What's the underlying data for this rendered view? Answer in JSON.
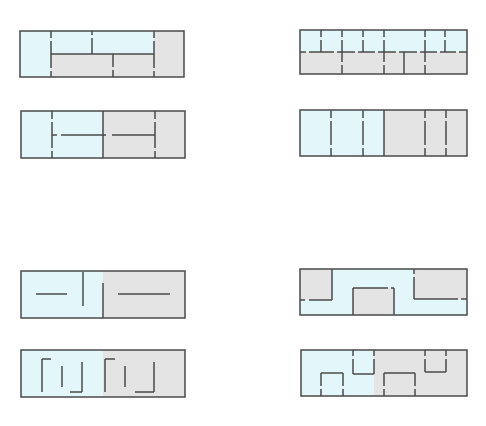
{
  "colors": {
    "blue": "#e3f6f9",
    "gray": "#e4e4e4",
    "line": "#4a4a4a",
    "background": "#ffffff"
  },
  "diagrams": [
    {
      "id": "d1",
      "position": "top-left-row1",
      "box": [
        20,
        31,
        184,
        77
      ],
      "fills": [
        {
          "color": "blue",
          "rect": [
            20,
            31,
            51,
            77
          ]
        },
        {
          "color": "blue",
          "rect": [
            51,
            31,
            154,
            54
          ]
        },
        {
          "color": "gray",
          "rect": [
            51,
            54,
            154,
            77
          ]
        },
        {
          "color": "gray",
          "rect": [
            154,
            31,
            184,
            77
          ]
        }
      ],
      "lines": [
        [
          51,
          31,
          51,
          38
        ],
        [
          51,
          41,
          51,
          68
        ],
        [
          51,
          71,
          51,
          77
        ],
        [
          92,
          31,
          92,
          35
        ],
        [
          92,
          38,
          92,
          54
        ],
        [
          154,
          31,
          154,
          38
        ],
        [
          154,
          41,
          154,
          68
        ],
        [
          154,
          71,
          154,
          77
        ],
        [
          51,
          54,
          154,
          54
        ],
        [
          113,
          54,
          113,
          67
        ],
        [
          113,
          70,
          113,
          77
        ]
      ]
    },
    {
      "id": "d2",
      "position": "top-left-row2",
      "box": [
        21,
        111,
        185,
        158
      ],
      "fills": [
        {
          "color": "blue",
          "rect": [
            21,
            111,
            103,
            158
          ]
        },
        {
          "color": "gray",
          "rect": [
            103,
            111,
            185,
            158
          ]
        }
      ],
      "lines": [
        [
          52,
          111,
          52,
          119
        ],
        [
          52,
          122,
          52,
          148
        ],
        [
          52,
          151,
          52,
          158
        ],
        [
          103,
          111,
          103,
          158
        ],
        [
          155,
          111,
          155,
          119
        ],
        [
          155,
          122,
          155,
          148
        ],
        [
          155,
          151,
          155,
          158
        ],
        [
          52,
          135,
          57,
          135
        ],
        [
          61,
          135,
          106,
          135
        ],
        [
          112,
          135,
          155,
          135
        ]
      ]
    },
    {
      "id": "d3",
      "position": "top-right-row1",
      "box": [
        300,
        30,
        467,
        74
      ],
      "fills": [
        {
          "color": "blue",
          "rect": [
            300,
            30,
            467,
            52
          ]
        },
        {
          "color": "gray",
          "rect": [
            300,
            52,
            467,
            74
          ]
        }
      ],
      "lines": [
        [
          300,
          52,
          306,
          52
        ],
        [
          309,
          52,
          334,
          52
        ],
        [
          337,
          52,
          355,
          52
        ],
        [
          358,
          52,
          375,
          52
        ],
        [
          378,
          52,
          396,
          52
        ],
        [
          399,
          52,
          417,
          52
        ],
        [
          420,
          52,
          437,
          52
        ],
        [
          440,
          52,
          456,
          52
        ],
        [
          459,
          52,
          467,
          52
        ],
        [
          321,
          30,
          321,
          37
        ],
        [
          321,
          40,
          321,
          52
        ],
        [
          342,
          30,
          342,
          37
        ],
        [
          342,
          40,
          342,
          62
        ],
        [
          342,
          65,
          342,
          74
        ],
        [
          363,
          30,
          363,
          37
        ],
        [
          363,
          40,
          363,
          52
        ],
        [
          384,
          30,
          384,
          37
        ],
        [
          384,
          40,
          384,
          62
        ],
        [
          384,
          65,
          384,
          74
        ],
        [
          404,
          52,
          404,
          74
        ],
        [
          425,
          30,
          425,
          37
        ],
        [
          425,
          40,
          425,
          62
        ],
        [
          425,
          65,
          425,
          74
        ],
        [
          445,
          30,
          445,
          37
        ],
        [
          445,
          40,
          445,
          52
        ]
      ]
    },
    {
      "id": "d4",
      "position": "top-right-row2",
      "box": [
        300,
        110,
        467,
        156
      ],
      "fills": [
        {
          "color": "blue",
          "rect": [
            300,
            110,
            384,
            156
          ]
        },
        {
          "color": "gray",
          "rect": [
            384,
            110,
            467,
            156
          ]
        }
      ],
      "lines": [
        [
          331,
          110,
          331,
          118
        ],
        [
          331,
          121,
          331,
          145
        ],
        [
          331,
          148,
          331,
          156
        ],
        [
          363,
          110,
          363,
          118
        ],
        [
          363,
          121,
          363,
          145
        ],
        [
          363,
          148,
          363,
          156
        ],
        [
          384,
          110,
          384,
          156
        ],
        [
          425,
          110,
          425,
          118
        ],
        [
          425,
          121,
          425,
          145
        ],
        [
          425,
          148,
          425,
          156
        ],
        [
          446,
          110,
          446,
          118
        ],
        [
          446,
          121,
          446,
          145
        ],
        [
          446,
          148,
          446,
          156
        ]
      ]
    },
    {
      "id": "d5",
      "position": "bottom-left-row1",
      "box": [
        21,
        271,
        185,
        318
      ],
      "fills": [
        {
          "color": "blue",
          "rect": [
            21,
            271,
            103,
            318
          ]
        },
        {
          "color": "gray",
          "rect": [
            103,
            271,
            185,
            318
          ]
        }
      ],
      "lines": [
        [
          36,
          294,
          67,
          294
        ],
        [
          83,
          272,
          83,
          306
        ],
        [
          103,
          283,
          103,
          318
        ],
        [
          118,
          294,
          170,
          294
        ]
      ]
    },
    {
      "id": "d6",
      "position": "bottom-left-row2",
      "box": [
        21,
        350,
        185,
        397
      ],
      "fills": [
        {
          "color": "blue",
          "rect": [
            21,
            350,
            103,
            397
          ]
        },
        {
          "color": "gray",
          "rect": [
            103,
            350,
            185,
            397
          ]
        }
      ],
      "lines": [
        [
          42,
          359,
          51,
          359
        ],
        [
          42,
          359,
          42,
          392
        ],
        [
          62,
          366,
          62,
          387
        ],
        [
          82,
          362,
          82,
          392
        ],
        [
          70,
          392,
          82,
          392
        ],
        [
          105,
          359,
          115,
          359
        ],
        [
          105,
          359,
          105,
          392
        ],
        [
          125,
          366,
          125,
          387
        ],
        [
          154,
          362,
          154,
          392
        ],
        [
          135,
          392,
          154,
          392
        ]
      ]
    },
    {
      "id": "d7",
      "position": "bottom-right-row1",
      "box": [
        300,
        269,
        467,
        315
      ],
      "fills": [
        {
          "color": "blue",
          "rect": [
            300,
            269,
            467,
            315
          ]
        },
        {
          "color": "gray",
          "rect": [
            300,
            269,
            332,
            300
          ]
        },
        {
          "color": "gray",
          "rect": [
            353,
            288,
            394,
            315
          ]
        },
        {
          "color": "gray",
          "rect": [
            414,
            269,
            467,
            299
          ]
        }
      ],
      "lines": [
        [
          332,
          269,
          332,
          300
        ],
        [
          300,
          300,
          305,
          300
        ],
        [
          309,
          300,
          332,
          300
        ],
        [
          353,
          315,
          353,
          288
        ],
        [
          353,
          288,
          388,
          288
        ],
        [
          391,
          288,
          394,
          288
        ],
        [
          394,
          288,
          394,
          315
        ],
        [
          414,
          269,
          414,
          274
        ],
        [
          414,
          277,
          414,
          299
        ],
        [
          414,
          299,
          458,
          299
        ],
        [
          461,
          299,
          467,
          299
        ]
      ]
    },
    {
      "id": "d8",
      "position": "bottom-right-row2",
      "box": [
        301,
        350,
        467,
        396
      ],
      "fills": [
        {
          "color": "blue",
          "rect": [
            301,
            350,
            374,
            396
          ]
        },
        {
          "color": "gray",
          "rect": [
            374,
            350,
            467,
            396
          ]
        }
      ],
      "lines": [
        [
          321,
          396,
          321,
          389
        ],
        [
          321,
          386,
          321,
          373
        ],
        [
          321,
          373,
          343,
          373
        ],
        [
          343,
          373,
          343,
          386
        ],
        [
          343,
          389,
          343,
          396
        ],
        [
          353,
          350,
          353,
          356
        ],
        [
          353,
          359,
          353,
          374
        ],
        [
          353,
          374,
          374,
          374
        ],
        [
          374,
          374,
          374,
          359
        ],
        [
          374,
          356,
          374,
          350
        ],
        [
          384,
          396,
          384,
          389
        ],
        [
          384,
          386,
          384,
          373
        ],
        [
          384,
          373,
          415,
          373
        ],
        [
          415,
          373,
          415,
          386
        ],
        [
          415,
          389,
          415,
          396
        ],
        [
          425,
          350,
          425,
          356
        ],
        [
          425,
          359,
          425,
          372
        ],
        [
          425,
          372,
          446,
          372
        ],
        [
          446,
          372,
          446,
          359
        ],
        [
          446,
          356,
          446,
          350
        ]
      ]
    }
  ]
}
